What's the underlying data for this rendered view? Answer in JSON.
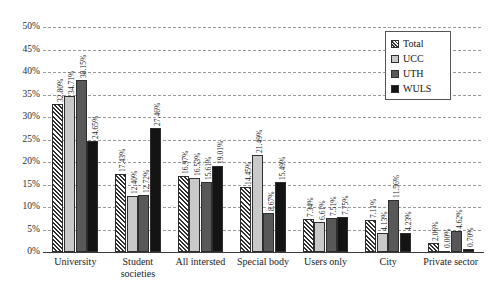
{
  "chart_data": {
    "type": "bar",
    "title": "",
    "subtitle": "",
    "xlabel": "",
    "ylabel": "",
    "ylim": [
      0,
      50
    ],
    "ytick_labels": [
      "0%",
      "5%",
      "10%",
      "15%",
      "20%",
      "25%",
      "30%",
      "35%",
      "40%",
      "45%",
      "50%"
    ],
    "ytick_values": [
      0,
      5,
      10,
      15,
      20,
      25,
      30,
      35,
      40,
      45,
      50
    ],
    "grid": true,
    "grid_style": "dashed-horizontal",
    "legend_position": "top-right-inside",
    "value_label_format": "percent-2dp-rotated-90",
    "categories": [
      "University",
      "Student societies",
      "All intersted",
      "Special body",
      "Users only",
      "City",
      "Private sector"
    ],
    "category_lines": [
      [
        "University"
      ],
      [
        "Student",
        "societies"
      ],
      [
        "All intersted"
      ],
      [
        "Special body"
      ],
      [
        "Users only"
      ],
      [
        "City"
      ],
      [
        "Private sector"
      ]
    ],
    "series": [
      {
        "name": "Total",
        "color": "#ffffff",
        "pattern": "diagonal-hatch",
        "values": [
          32.8,
          17.43,
          16.97,
          14.45,
          7.34,
          7.11,
          2.06
        ],
        "labels": [
          "32.80%",
          "17.43%",
          "16.97%",
          "14.45%",
          "7.34%",
          "7.11%",
          "2.06%"
        ]
      },
      {
        "name": "UCC",
        "color": "#c9c9c9",
        "pattern": "solid",
        "values": [
          34.71,
          12.4,
          16.53,
          21.49,
          6.61,
          4.13,
          0.0
        ],
        "labels": [
          "34.71%",
          "12.40%",
          "16.53%",
          "21.49%",
          "6.61%",
          "4.13%",
          "0.00%"
        ]
      },
      {
        "name": "UTH",
        "color": "#585858",
        "pattern": "solid",
        "values": [
          38.15,
          12.72,
          15.61,
          8.67,
          7.51,
          11.56,
          4.62
        ],
        "labels": [
          "38.15%",
          "12.72%",
          "15.61%",
          "8.67%",
          "7.51%",
          "11.56%",
          "4.62%"
        ]
      },
      {
        "name": "WULS",
        "color": "#141414",
        "pattern": "solid",
        "values": [
          24.65,
          27.46,
          19.01,
          15.49,
          7.75,
          4.23,
          0.7
        ],
        "labels": [
          "24.65%",
          "27.46%",
          "19.01%",
          "15.49%",
          "7.75%",
          "4.23%",
          "0.70%"
        ]
      }
    ]
  },
  "legend": {
    "items": [
      {
        "label": "Total"
      },
      {
        "label": "UCC"
      },
      {
        "label": "UTH"
      },
      {
        "label": "WULS"
      }
    ]
  }
}
